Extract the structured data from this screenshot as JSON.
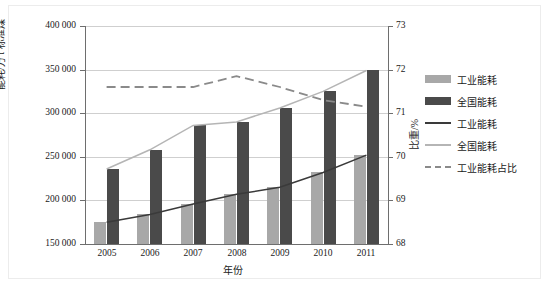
{
  "chart_data": {
    "type": "bar",
    "title": "",
    "xlabel": "年份",
    "ylabel": "能耗/万 t 标准煤",
    "y2label": "比重/%",
    "grid": true,
    "legend_position": "right",
    "categories": [
      "2005",
      "2006",
      "2007",
      "2008",
      "2009",
      "2010",
      "2011"
    ],
    "ylim": [
      150000,
      400000
    ],
    "yticks": [
      "150 000",
      "200 000",
      "250 000",
      "300 000",
      "350 000",
      "400 000"
    ],
    "ytick_values": [
      150000,
      200000,
      250000,
      300000,
      350000,
      400000
    ],
    "y2lim": [
      68,
      73
    ],
    "y2ticks": [
      "68",
      "69",
      "70",
      "71",
      "72",
      "73"
    ],
    "y2tick_values": [
      68,
      69,
      70,
      71,
      72,
      73
    ],
    "series": [
      {
        "name": "工业能耗",
        "kind": "bar",
        "color": "#a8a8a8",
        "axis": "left",
        "values": [
          175000,
          184000,
          196000,
          207000,
          215000,
          232000,
          252000
        ]
      },
      {
        "name": "全国能耗",
        "kind": "bar",
        "color": "#4a4a4a",
        "axis": "left",
        "values": [
          236000,
          258000,
          286000,
          290000,
          306000,
          325000,
          349000
        ]
      },
      {
        "name": "工业能耗",
        "kind": "line",
        "style": "solid",
        "color": "#3a3a3a",
        "axis": "left",
        "values": [
          175000,
          184000,
          196000,
          207000,
          215000,
          232000,
          252000
        ]
      },
      {
        "name": "全国能耗",
        "kind": "line",
        "style": "solid",
        "color": "#b5b5b5",
        "axis": "left",
        "values": [
          236000,
          258000,
          286000,
          290000,
          306000,
          325000,
          349000
        ]
      },
      {
        "name": "工业能耗占比",
        "kind": "line",
        "style": "dashed",
        "color": "#8a8a8a",
        "axis": "right",
        "values": [
          71.6,
          71.6,
          71.6,
          71.85,
          71.6,
          71.3,
          71.15
        ]
      }
    ]
  },
  "legend": {
    "items": [
      {
        "label": "工业能耗",
        "swatch": "bar-light"
      },
      {
        "label": "全国能耗",
        "swatch": "bar-dark"
      },
      {
        "label": "工业能耗",
        "swatch": "line-dark"
      },
      {
        "label": "全国能耗",
        "swatch": "line-light"
      },
      {
        "label": "工业能耗占比",
        "swatch": "line-dashed"
      }
    ]
  },
  "colors": {
    "bar_light": "#a8a8a8",
    "bar_dark": "#4a4a4a",
    "line_dark": "#3a3a3a",
    "line_light": "#b5b5b5",
    "line_dashed": "#8a8a8a",
    "grid": "#cfcfcf",
    "axis": "#6e6e6e"
  }
}
